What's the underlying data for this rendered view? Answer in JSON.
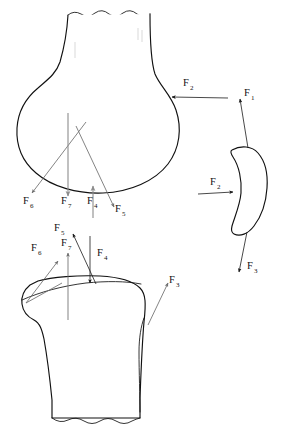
{
  "figure": {
    "background_color": "#ffffff",
    "line_color": "#111111",
    "accent_grey": "#8c8c8c",
    "width": 288,
    "height": 436
  },
  "parts": [
    {
      "id": "femur",
      "name": "Distal femur (upper bone)",
      "cut_edge": "jagged"
    },
    {
      "id": "tibia",
      "name": "Proximal tibia (lower bone)",
      "cut_edge": "jagged"
    },
    {
      "id": "patella",
      "name": "Patella (right inset)",
      "cut_edge": "none"
    }
  ],
  "forces": {
    "femur": [
      {
        "label": "F",
        "sub": "2",
        "direction": "left",
        "x": 184,
        "y": 88
      },
      {
        "label": "F",
        "sub": "6",
        "direction": "down-left",
        "x": 24,
        "y": 205
      },
      {
        "label": "F",
        "sub": "7",
        "direction": "down",
        "x": 62,
        "y": 205
      },
      {
        "label": "F",
        "sub": "4",
        "direction": "up",
        "x": 88,
        "y": 205
      },
      {
        "label": "F",
        "sub": "5",
        "direction": "down-right",
        "x": 116,
        "y": 213
      }
    ],
    "tibia": [
      {
        "label": "F",
        "sub": "6",
        "direction": "up-right",
        "x": 32,
        "y": 252
      },
      {
        "label": "F",
        "sub": "5",
        "direction": "up-right",
        "x": 55,
        "y": 232
      },
      {
        "label": "F",
        "sub": "7",
        "direction": "up",
        "x": 62,
        "y": 247
      },
      {
        "label": "F",
        "sub": "4",
        "direction": "down",
        "x": 98,
        "y": 257
      },
      {
        "label": "F",
        "sub": "3",
        "direction": "up-right",
        "x": 170,
        "y": 284
      }
    ],
    "patella": [
      {
        "label": "F",
        "sub": "1",
        "direction": "up",
        "x": 245,
        "y": 97
      },
      {
        "label": "F",
        "sub": "2",
        "direction": "right",
        "x": 211,
        "y": 186
      },
      {
        "label": "F",
        "sub": "3",
        "direction": "down-left",
        "x": 248,
        "y": 270
      }
    ]
  },
  "force_legend": [
    {
      "symbol": "F1",
      "description": "Quadriceps tendon force on patella"
    },
    {
      "symbol": "F2",
      "description": "Patellofemoral contact force"
    },
    {
      "symbol": "F3",
      "description": "Patellar ligament force"
    },
    {
      "symbol": "F4",
      "description": "Tibiofemoral contact force"
    },
    {
      "symbol": "F5",
      "description": "Cruciate ligament force"
    },
    {
      "symbol": "F6",
      "description": "Collateral ligament force"
    },
    {
      "symbol": "F7",
      "description": "Joint reaction force"
    }
  ]
}
